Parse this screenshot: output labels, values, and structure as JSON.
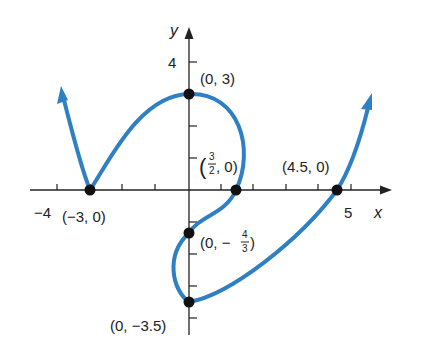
{
  "figure": {
    "axes": {
      "x_label": "x",
      "y_label": "y",
      "x_ticks": [
        "−4",
        "5"
      ],
      "y_ticks": [
        "4"
      ]
    },
    "points": [
      {
        "label": "(0, 3)",
        "x": 0,
        "y": 3
      },
      {
        "label": "(−3, 0)",
        "x": -3,
        "y": 0
      },
      {
        "label_prefix": "(",
        "frac_num": "3",
        "frac_den": "2",
        "label_suffix": ", 0)",
        "x": 1.5,
        "y": 0
      },
      {
        "label": "(4.5, 0)",
        "x": 4.5,
        "y": 0
      },
      {
        "label_prefix": "(0, −",
        "frac_num": "4",
        "frac_den": "3",
        "label_suffix": ")",
        "x": 0,
        "y": -1.333
      },
      {
        "label": "(0, −3.5)",
        "x": 0,
        "y": -3.5
      }
    ],
    "curve_color": "#2f7fc4"
  }
}
